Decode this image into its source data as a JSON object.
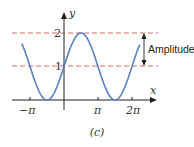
{
  "chart_data": {
    "type": "line",
    "title": "",
    "caption": "(c)",
    "xlabel": "x",
    "ylabel": "y",
    "function": "y = 1 + sin(x)",
    "xlim": [
      -3.9,
      8.3
    ],
    "ylim": [
      0,
      2.4
    ],
    "x_ticks": [
      {
        "value": -3.14159,
        "label": "−π"
      },
      {
        "value": 3.14159,
        "label": "π"
      },
      {
        "value": 6.28319,
        "label": "2π"
      }
    ],
    "y_ticks": [
      {
        "value": 1,
        "label": "1"
      },
      {
        "value": 2,
        "label": "2"
      }
    ],
    "reference_lines": [
      {
        "y": 2,
        "style": "dashed",
        "color": "#e06666"
      },
      {
        "y": 1,
        "style": "dashed",
        "color": "#e06666"
      }
    ],
    "annotation": {
      "label": "Amplitude",
      "from_y": 1,
      "to_y": 2,
      "type": "double-arrow"
    },
    "series": [
      {
        "name": "1 + sin x",
        "color": "#5b7fc4",
        "x_start": -3.9,
        "x_end": 7.0
      }
    ],
    "grid": false,
    "legend": "none"
  },
  "labels": {
    "x_axis": "x",
    "y_axis": "y",
    "tick_neg_pi": "−π",
    "tick_pi": "π",
    "tick_2pi": "2π",
    "tick_1": "1",
    "tick_2": "2",
    "amplitude": "Amplitude",
    "caption": "(c)"
  },
  "colors": {
    "curve": "#5b7fc4",
    "dashed": "#e06666",
    "axis": "#222222"
  }
}
